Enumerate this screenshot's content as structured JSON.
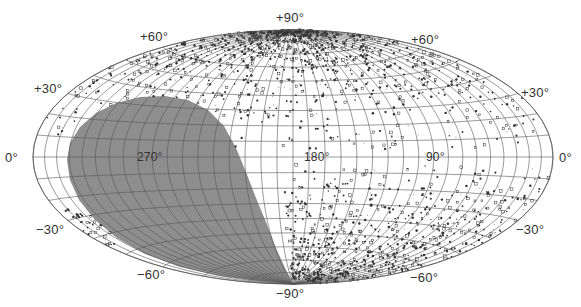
{
  "chart_data": {
    "type": "scatter",
    "title": "",
    "projection": "hammer-aitoff",
    "coordinate_system": "galactic",
    "xlabel": "Galactic longitude",
    "ylabel": "Galactic latitude",
    "longitude_ticks": [
      "270°",
      "180°",
      "90°",
      "0°"
    ],
    "latitude_ticks": [
      "+90°",
      "+60°",
      "+30°",
      "0°",
      "−30°",
      "−60°",
      "−90°"
    ],
    "grid": {
      "on": true,
      "longitude_step_deg": 10,
      "latitude_step_deg": 10
    },
    "xlim": [
      0,
      360
    ],
    "ylim": [
      -90,
      90
    ],
    "shaded_region": {
      "description": "Unsurveyed / excluded region (grey)",
      "color": "#8e8e8e",
      "approx_extent": {
        "lon_min": 180,
        "lon_max": 340,
        "lat_min": -90,
        "lat_max": 40
      }
    },
    "series": [
      {
        "name": "objects (dense, northern hemisphere)",
        "marker": "dot/open-square",
        "density_note": "concentrated at lat +30° to +90°, longitudes 0°–360°"
      },
      {
        "name": "objects (southern hemisphere)",
        "marker": "dot/open-square",
        "density_note": "concentrated at lat −20° to −70°, longitudes 0°–180°"
      }
    ]
  },
  "labels": {
    "north_pole": "+90°",
    "south_pole": "−90°",
    "lat_p60_left": "+60°",
    "lat_p60_right": "+60°",
    "lat_p30_left": "+30°",
    "lat_p30_right": "+30°",
    "lat_0_left": "0°",
    "lat_0_right": "0°",
    "lat_m30_left": "−30°",
    "lat_m30_right": "−30°",
    "lat_m60_left": "−60°",
    "lat_m60_right": "−60°",
    "lon_270": "270°",
    "lon_180": "180°",
    "lon_90": "90°"
  },
  "colors": {
    "grid": "#555555",
    "shade": "#8e8e8e",
    "points": "#333333",
    "background": "#ffffff"
  }
}
